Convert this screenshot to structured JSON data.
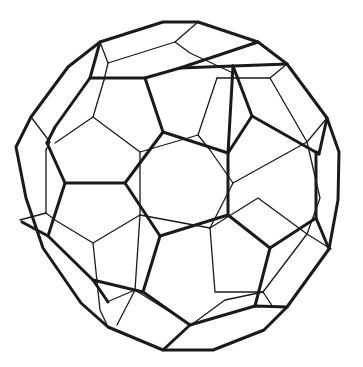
{
  "figure": {
    "background": "#ffffff",
    "line_color": "#1a1a1a"
  }
}
